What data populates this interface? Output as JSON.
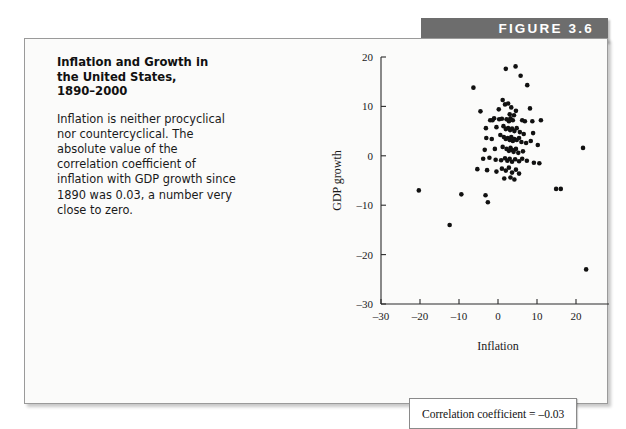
{
  "figure": {
    "banner_label": "FIGURE 3.6",
    "banner_color": "#6d6d6d",
    "background_color": "#fbfbfa",
    "border_color": "#9a9a9a"
  },
  "caption": {
    "title": "Inflation and Growth in\nthe United States,\n1890–2000",
    "body": "Inflation is neither procyclical nor countercyclical. The absolute value of the correlation coefficient of inflation with GDP growth since 1890 was 0.03, a number very close to zero."
  },
  "annotation": {
    "correlation_label": "Correlation coefficient = –0.03"
  },
  "chart_data": {
    "type": "scatter",
    "title": "",
    "xlabel": "Inflation",
    "ylabel": "GDP growth",
    "xlim": [
      -30,
      30
    ],
    "ylim": [
      -30,
      20
    ],
    "xticks": [
      -30,
      -20,
      -10,
      0,
      10,
      20,
      30
    ],
    "yticks": [
      20,
      10,
      0,
      -10,
      -20,
      -30
    ],
    "xtick_labels": [
      "–30",
      "–20",
      "–10",
      "0",
      "10",
      "20",
      "30"
    ],
    "ytick_labels": [
      "20",
      "10",
      "0",
      "–10",
      "–20",
      "–30"
    ],
    "grid": false,
    "legend": null,
    "marker_color": "#111111",
    "marker_size": 2.3,
    "points": [
      [
        2.0,
        17.6
      ],
      [
        4.5,
        18.1
      ],
      [
        5.8,
        16.2
      ],
      [
        7.5,
        14.3
      ],
      [
        -6.3,
        13.8
      ],
      [
        1.2,
        11.3
      ],
      [
        1.8,
        10.4
      ],
      [
        2.6,
        10.6
      ],
      [
        -4.5,
        9.0
      ],
      [
        0.2,
        9.4
      ],
      [
        3.4,
        9.8
      ],
      [
        3.0,
        8.4
      ],
      [
        4.1,
        8.2
      ],
      [
        4.6,
        9.1
      ],
      [
        8.2,
        9.6
      ],
      [
        -1.0,
        7.6
      ],
      [
        -2.0,
        7.2
      ],
      [
        -1.4,
        7.2
      ],
      [
        0.3,
        7.4
      ],
      [
        1.0,
        7.5
      ],
      [
        2.2,
        7.4
      ],
      [
        2.8,
        7.0
      ],
      [
        3.2,
        7.6
      ],
      [
        3.8,
        7.2
      ],
      [
        6.2,
        7.2
      ],
      [
        6.9,
        7.0
      ],
      [
        8.8,
        7.0
      ],
      [
        11.0,
        7.2
      ],
      [
        -3.1,
        5.6
      ],
      [
        -0.4,
        5.8
      ],
      [
        1.4,
        6.0
      ],
      [
        2.0,
        5.4
      ],
      [
        2.6,
        5.6
      ],
      [
        3.1,
        5.2
      ],
      [
        3.6,
        5.5
      ],
      [
        4.2,
        5.0
      ],
      [
        4.8,
        5.6
      ],
      [
        5.6,
        4.8
      ],
      [
        6.6,
        4.4
      ],
      [
        9.0,
        4.6
      ],
      [
        -3.0,
        3.6
      ],
      [
        -1.6,
        3.4
      ],
      [
        0.6,
        4.2
      ],
      [
        1.5,
        3.8
      ],
      [
        2.0,
        3.4
      ],
      [
        2.5,
        3.6
      ],
      [
        3.0,
        3.2
      ],
      [
        3.4,
        3.8
      ],
      [
        3.8,
        3.0
      ],
      [
        4.2,
        3.4
      ],
      [
        4.8,
        3.2
      ],
      [
        5.4,
        3.6
      ],
      [
        6.0,
        2.8
      ],
      [
        7.2,
        2.6
      ],
      [
        8.4,
        3.0
      ],
      [
        10.2,
        2.2
      ],
      [
        21.8,
        1.6
      ],
      [
        -3.4,
        1.2
      ],
      [
        -0.8,
        1.4
      ],
      [
        1.2,
        1.8
      ],
      [
        2.2,
        1.4
      ],
      [
        2.8,
        1.0
      ],
      [
        3.2,
        1.6
      ],
      [
        3.6,
        1.2
      ],
      [
        4.0,
        0.8
      ],
      [
        4.6,
        1.4
      ],
      [
        5.2,
        0.6
      ],
      [
        6.4,
        0.9
      ],
      [
        -3.8,
        -0.6
      ],
      [
        -2.2,
        -0.4
      ],
      [
        -0.6,
        -0.8
      ],
      [
        0.8,
        -0.9
      ],
      [
        1.8,
        -0.5
      ],
      [
        2.4,
        -1.0
      ],
      [
        3.0,
        -0.6
      ],
      [
        3.6,
        -1.2
      ],
      [
        4.4,
        -0.7
      ],
      [
        5.4,
        -1.1
      ],
      [
        6.2,
        -0.6
      ],
      [
        7.4,
        -1.0
      ],
      [
        9.2,
        -1.4
      ],
      [
        10.6,
        -1.5
      ],
      [
        -5.3,
        -2.7
      ],
      [
        -2.8,
        -2.9
      ],
      [
        -0.4,
        -3.2
      ],
      [
        1.0,
        -2.6
      ],
      [
        2.0,
        -3.0
      ],
      [
        2.8,
        -2.4
      ],
      [
        3.6,
        -3.4
      ],
      [
        4.6,
        -2.8
      ],
      [
        5.4,
        -3.6
      ],
      [
        1.6,
        -4.6
      ],
      [
        3.2,
        -4.4
      ],
      [
        4.2,
        -4.8
      ],
      [
        -20.3,
        -7.0
      ],
      [
        -9.4,
        -7.8
      ],
      [
        -3.2,
        -8.0
      ],
      [
        14.9,
        -6.7
      ],
      [
        16.1,
        -6.7
      ],
      [
        -2.6,
        -9.4
      ],
      [
        -12.4,
        -14.0
      ],
      [
        22.6,
        -23.0
      ]
    ]
  }
}
